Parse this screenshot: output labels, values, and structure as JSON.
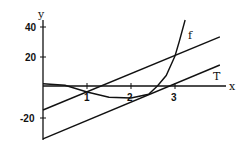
{
  "chart_data": {
    "type": "line",
    "title": "",
    "xlabel": "x",
    "ylabel": "y",
    "xlim": [
      0,
      4.1
    ],
    "ylim": [
      -35,
      47
    ],
    "grid": false,
    "x_ticks": [
      "1",
      "2",
      "3"
    ],
    "y_ticks": [
      "40",
      "20",
      "-20"
    ],
    "series": [
      {
        "name": "f",
        "label": "f",
        "x": [
          0,
          0.5,
          1,
          1.5,
          2,
          2.4,
          2.6,
          2.8,
          3,
          3.1,
          3.23
        ],
        "y": [
          1.5,
          0.5,
          -4,
          -7.5,
          -8,
          -5.5,
          0,
          7,
          20,
          30,
          44
        ]
      },
      {
        "name": "secant",
        "label": "",
        "x": [
          0,
          4.02
        ],
        "y": [
          -16,
          32.7
        ]
      },
      {
        "name": "T",
        "label": "T",
        "x": [
          0,
          4.02
        ],
        "y": [
          -35.3,
          14
        ]
      }
    ]
  },
  "labels": {
    "x_axis": "x",
    "y_axis": "y",
    "curve": "f",
    "tangent": "T"
  },
  "ticks": {
    "x1": "1",
    "x2": "2",
    "x3": "3",
    "y40": "40",
    "y20": "20",
    "yneg20": "-20"
  }
}
